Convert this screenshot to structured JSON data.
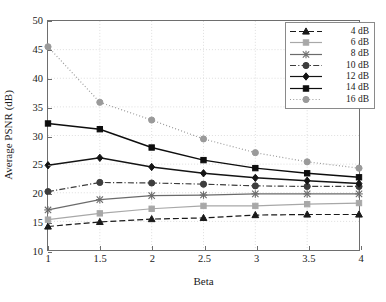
{
  "chart_data": {
    "type": "line",
    "title": "",
    "xlabel": "Beta",
    "ylabel": "Average PSNR (dB)",
    "x": [
      1,
      1.5,
      2,
      2.5,
      3,
      3.5,
      4
    ],
    "xticklabels": [
      "1",
      "1.5",
      "2",
      "2.5",
      "3",
      "3.5",
      "4"
    ],
    "yticklabels": [
      "10",
      "15",
      "20",
      "25",
      "30",
      "35",
      "40",
      "45",
      "50"
    ],
    "yticks": [
      10,
      15,
      20,
      25,
      30,
      35,
      40,
      45,
      50
    ],
    "xlim": [
      1,
      4
    ],
    "ylim": [
      10,
      50
    ],
    "grid": true,
    "grid_style": "dotted",
    "legend_position": "top-right",
    "series": [
      {
        "name": "4 dB",
        "values": [
          14.1,
          14.9,
          15.4,
          15.6,
          16.1,
          16.2,
          16.2
        ],
        "color": "#1a1a1a",
        "linestyle": "dashed",
        "marker": "triangle"
      },
      {
        "name": "6 dB",
        "values": [
          15.3,
          16.4,
          17.2,
          17.7,
          17.7,
          18.0,
          18.2
        ],
        "color": "#a8a8a8",
        "linestyle": "solid",
        "marker": "square"
      },
      {
        "name": "8 dB",
        "values": [
          17.0,
          18.8,
          19.5,
          19.6,
          19.8,
          19.8,
          19.8
        ],
        "color": "#6b6b6b",
        "linestyle": "solid",
        "marker": "star"
      },
      {
        "name": "10 dB",
        "values": [
          20.2,
          21.8,
          21.7,
          21.5,
          21.2,
          21.1,
          21.1
        ],
        "color": "#3d3d3d",
        "linestyle": "dashdot",
        "marker": "circle"
      },
      {
        "name": "12 dB",
        "values": [
          24.8,
          26.1,
          24.5,
          23.4,
          22.6,
          22.1,
          21.6
        ],
        "color": "#141414",
        "linestyle": "solid",
        "marker": "diamond"
      },
      {
        "name": "14 dB",
        "values": [
          32.1,
          31.1,
          27.9,
          25.7,
          24.3,
          23.4,
          22.7
        ],
        "color": "#0d0d0d",
        "linestyle": "solid",
        "marker": "square"
      },
      {
        "name": "16 dB",
        "values": [
          45.5,
          35.8,
          32.7,
          29.4,
          27.0,
          25.4,
          24.3
        ],
        "color": "#9a9a9a",
        "linestyle": "dotted",
        "marker": "circle"
      }
    ]
  },
  "axes": {
    "frame_color": "#6e6e6e",
    "grid_color": "#cfcfcf"
  }
}
